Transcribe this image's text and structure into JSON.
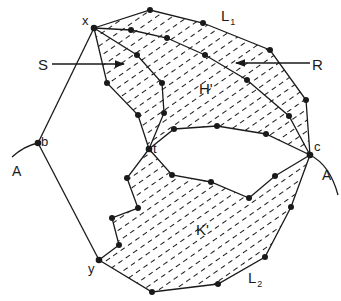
{
  "diagram": {
    "title": "",
    "colors": {
      "ink": "#1a1a1a",
      "background": "#ffffff"
    },
    "labels": {
      "x": "x",
      "y": "y",
      "b": "b",
      "t": "t",
      "c": "c",
      "A_left": "A",
      "A_right": "A",
      "S": "S",
      "R": "R",
      "H": "H'",
      "K": "K'",
      "L1_main": "L",
      "L1_sub": "1",
      "L2_main": "L",
      "L2_sub": "2"
    },
    "regions": [
      {
        "name": "H'",
        "fill": "hatched"
      },
      {
        "name": "K'",
        "fill": "hatched"
      }
    ],
    "curves": [
      "A (through b)",
      "A (through c)"
    ],
    "paths": [
      "L1",
      "L2",
      "S arrow",
      "R arrow"
    ]
  }
}
